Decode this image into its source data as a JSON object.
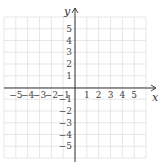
{
  "chart_data": {
    "type": "scatter",
    "title": "",
    "xlabel": "x",
    "ylabel": "y",
    "xlim": [
      -6,
      6
    ],
    "ylim": [
      -6,
      6
    ],
    "grid": true,
    "x_ticks": [
      -5,
      -4,
      -3,
      -2,
      -1,
      1,
      2,
      3,
      4,
      5
    ],
    "y_ticks": [
      5,
      4,
      3,
      2,
      1,
      -1,
      -2,
      -3,
      -4,
      -5
    ],
    "x_tick_labels": [
      "−5",
      "−4",
      "−3",
      "−2",
      "−1",
      "1",
      "2",
      "3",
      "4",
      "5"
    ],
    "y_tick_labels": [
      "5",
      "4",
      "3",
      "2",
      "1",
      "−1",
      "−2",
      "−3",
      "−4",
      "−5"
    ],
    "series": [],
    "legend": null
  },
  "colors": {
    "grid": "#dcdcdc",
    "axis": "#333333",
    "text": "#444444"
  }
}
